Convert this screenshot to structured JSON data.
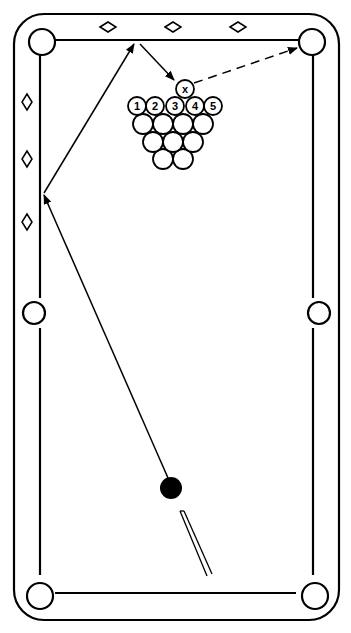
{
  "diagram": {
    "type": "pool-table-shot-diagram",
    "colors": {
      "line": "#000000",
      "background": "#ffffff",
      "cue_ball": "#000000"
    },
    "rack": {
      "target_ball_label": "x",
      "front_row_labels": [
        "1",
        "2",
        "3",
        "4",
        "5"
      ],
      "rows": [
        5,
        4,
        3,
        2
      ]
    },
    "paths": {
      "cue_path": "cue ball → left rail → top rail → ball x",
      "object_ball_path": "ball x → top-right corner pocket (dashed)"
    },
    "diamonds": {
      "top_rail": 3,
      "left_rail": 3
    },
    "pockets": 6
  }
}
